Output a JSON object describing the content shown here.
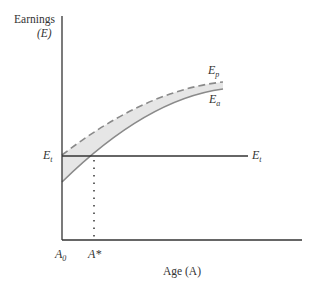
{
  "figure": {
    "y_axis_label_line1": "Earnings",
    "y_axis_label_line2": "(E)",
    "x_axis_label": "Age (A)",
    "labels": {
      "ep_main": "E",
      "ep_sub": "p",
      "ea_main": "E",
      "ea_sub": "a",
      "et_left_main": "E",
      "et_left_sub": "t",
      "et_right_main": "E",
      "et_right_sub": "t",
      "a0_main": "A",
      "a0_sub": "0",
      "astar": "A*"
    },
    "colors": {
      "axis": "#333333",
      "ep_curve": "#7f7f7f",
      "ea_curve": "#7f7f7f",
      "shading": "#e6e6e6",
      "et_line": "#333333",
      "dotted": "#333333"
    },
    "curves": [
      {
        "name": "Ep",
        "style": "dashed",
        "description": "Potential earnings"
      },
      {
        "name": "Ea",
        "style": "solid",
        "description": "Actual earnings"
      },
      {
        "name": "Et",
        "style": "solid",
        "description": "Constant earnings level"
      }
    ]
  }
}
